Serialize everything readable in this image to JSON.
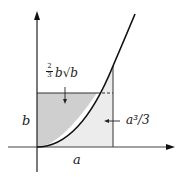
{
  "diagram": {
    "title": "",
    "colors": {
      "axis": "#333333",
      "curve": "#111111",
      "region_above_curve": "#cfcfcf",
      "region_below_curve": "#ececec",
      "background": "#ffffff"
    },
    "labels": {
      "area_left": {
        "frac_num": "2",
        "frac_den": "3",
        "expr": "b√b",
        "text": "(2/3) b√b"
      },
      "area_right": {
        "text": "a³/3"
      },
      "y_value": {
        "text": "b"
      },
      "x_value": {
        "text": "a"
      }
    },
    "elements": {
      "curve": "y = x² (parabola from origin)",
      "x_axis": "horizontal axis with arrow",
      "y_axis": "vertical axis with arrow",
      "rectangle_height": "b",
      "rectangle_width": "a",
      "dashed_segment": "continuation of line y=b from curve to x=a"
    }
  }
}
